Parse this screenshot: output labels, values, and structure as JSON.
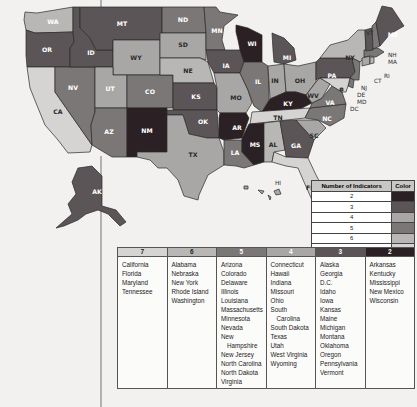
{
  "colors": {
    "2": "#2b2023",
    "3": "#5b5557",
    "4": "#a9a7a6",
    "5": "#7b7777",
    "6": "#b9b7b5",
    "7": "#d6d4d2"
  },
  "legend": {
    "header_number": "Number of Indicators",
    "header_color": "Color",
    "rows": [
      {
        "value": "2"
      },
      {
        "value": "3"
      },
      {
        "value": "4"
      },
      {
        "value": "5"
      },
      {
        "value": "6"
      },
      {
        "value": "7"
      }
    ]
  },
  "table": {
    "columns": [
      {
        "header": "7",
        "states": [
          "California",
          "Florida",
          "Maryland",
          "Tennessee"
        ]
      },
      {
        "header": "6",
        "states": [
          "Alabama",
          "Nebraska",
          "New York",
          "Rhode Island",
          "Washington"
        ]
      },
      {
        "header": "5",
        "states": [
          "Arizona",
          "Colorado",
          "Delaware",
          "Illinois",
          "Louisiana",
          "Massachusetts",
          "Minnesota",
          "Nevada",
          "New",
          "Hampshire",
          "New Jersey",
          "North Carolina",
          "North Dakota",
          "Virginia"
        ]
      },
      {
        "header": "4",
        "states": [
          "Connecticut",
          "Hawaii",
          "Indiana",
          "Missouri",
          "Ohio",
          "South",
          "Carolina",
          "South Dakota",
          "Texas",
          "Utah",
          "West Virginia",
          "Wyoming"
        ]
      },
      {
        "header": "3",
        "states": [
          "Alaska",
          "Georgia",
          "D.C.",
          "Idaho",
          "Iowa",
          "Kansas",
          "Maine",
          "Michigan",
          "Montana",
          "Oklahoma",
          "Oregon",
          "Pennsylvania",
          "Vermont"
        ]
      },
      {
        "header": "2",
        "states": [
          "Arkansas",
          "Kentucky",
          "Mississippi",
          "New Mexico",
          "Wisconsin"
        ]
      }
    ]
  },
  "map": {
    "states": {
      "WA": 6,
      "OR": 3,
      "CA": 7,
      "NV": 5,
      "ID": 3,
      "MT": 3,
      "WY": 4,
      "UT": 4,
      "AZ": 5,
      "CO": 5,
      "NM": 2,
      "ND": 5,
      "SD": 4,
      "NE": 6,
      "KS": 3,
      "OK": 3,
      "TX": 4,
      "MN": 5,
      "IA": 3,
      "MO": 4,
      "AR": 2,
      "LA": 5,
      "WI": 2,
      "IL": 5,
      "MI": 3,
      "IN": 4,
      "OH": 4,
      "KY": 2,
      "TN": 7,
      "MS": 2,
      "AL": 6,
      "GA": 3,
      "FL": 7,
      "SC": 4,
      "NC": 5,
      "VA": 5,
      "WV": 4,
      "PA": 3,
      "NY": 6,
      "VT": 3,
      "NH": 5,
      "ME": 3,
      "MA": 5,
      "RI": 6,
      "CT": 4,
      "NJ": 5,
      "DE": 5,
      "MD": 7,
      "DC": 3,
      "AK": 3,
      "HI": 4
    }
  }
}
